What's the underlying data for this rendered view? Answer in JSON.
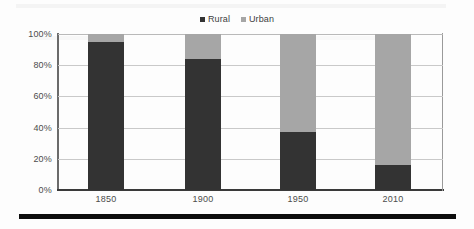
{
  "chart_data": {
    "type": "bar",
    "subtype": "stacked-column-100pct",
    "title": "",
    "xlabel": "",
    "ylabel": "",
    "categories": [
      "1850",
      "1900",
      "1950",
      "2010"
    ],
    "series": [
      {
        "name": "Rural",
        "color": "#333333",
        "values": [
          95,
          84,
          37,
          16
        ]
      },
      {
        "name": "Urban",
        "color": "#a6a6a6",
        "values": [
          5,
          16,
          63,
          84
        ]
      }
    ],
    "ylim": [
      0,
      100
    ],
    "ytick_values": [
      0,
      20,
      40,
      60,
      80,
      100
    ],
    "ytick_labels": [
      "0%",
      "20%",
      "40%",
      "60%",
      "80%",
      "100%"
    ],
    "grid": true,
    "grid_axis": "y",
    "legend_position": "top-center",
    "value_suffix": "%"
  },
  "legend": {
    "entries": [
      {
        "label": "Rural",
        "color": "#333333",
        "swatch_name": "legend-swatch-rural"
      },
      {
        "label": "Urban",
        "color": "#a6a6a6",
        "swatch_name": "legend-swatch-urban"
      }
    ]
  },
  "axes": {
    "y_labels": [
      "100%",
      "80%",
      "60%",
      "40%",
      "20%",
      "0%"
    ],
    "x_labels": [
      "1850",
      "1900",
      "1950",
      "2010"
    ]
  },
  "colors": {
    "rural": "#333333",
    "urban": "#a6a6a6",
    "gridline": "#c9c9c9",
    "axis": "#3a3a3a",
    "text": "#4c4c4c",
    "rule": "#0d0d0d",
    "background": "#fdfdfd"
  }
}
